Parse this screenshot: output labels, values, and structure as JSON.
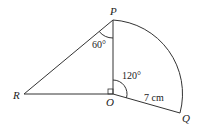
{
  "diagram": {
    "points": {
      "P": {
        "label": "P",
        "x": 113,
        "y": 20
      },
      "O": {
        "label": "O",
        "x": 113,
        "y": 94
      },
      "R": {
        "label": "R",
        "x": 24,
        "y": 94
      },
      "Q": {
        "label": "Q",
        "x": 180,
        "y": 113
      }
    },
    "angles": {
      "RPO": "60°",
      "POQ": "120°",
      "ROP": "right angle"
    },
    "lengths": {
      "OQ": "7 cm"
    },
    "stroke_color": "#333333"
  }
}
